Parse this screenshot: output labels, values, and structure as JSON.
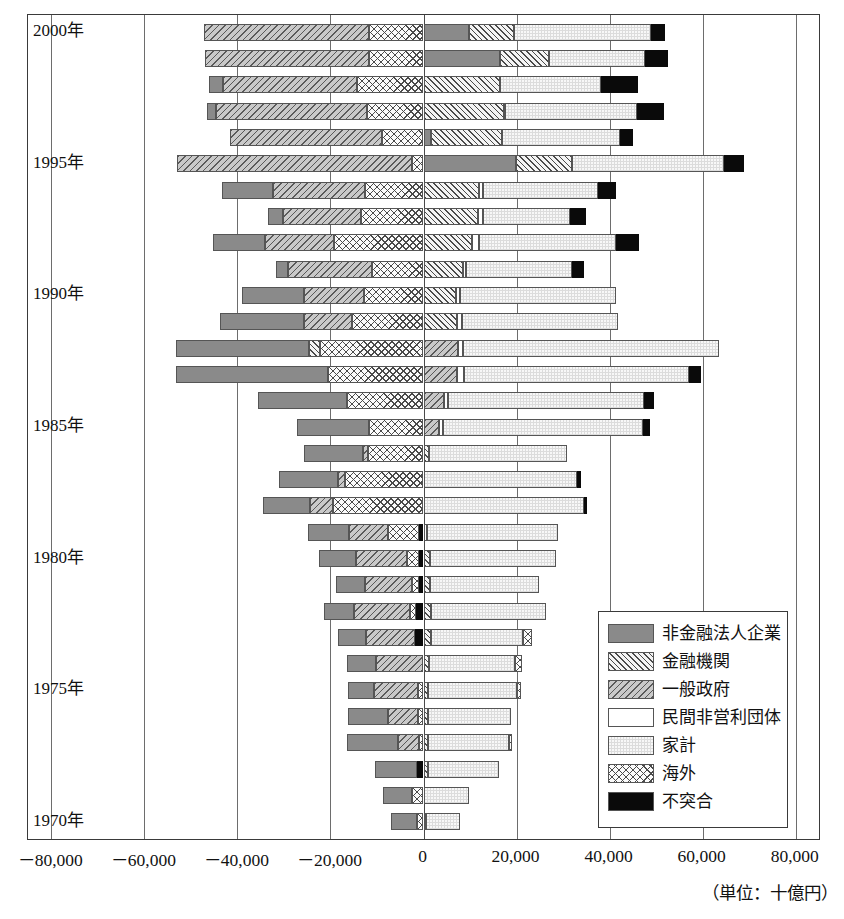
{
  "axis": {
    "unit_note": "（単位：十億円）",
    "x_ticks": [
      {
        "label": "－80,000",
        "value": -80000
      },
      {
        "label": "－60,000",
        "value": -60000
      },
      {
        "label": "－40,000",
        "value": -40000
      },
      {
        "label": "－20,000",
        "value": -20000
      },
      {
        "label": "0",
        "value": 0
      },
      {
        "label": "20,000",
        "value": 20000
      },
      {
        "label": "40,000",
        "value": 40000
      },
      {
        "label": "60,000",
        "value": 60000
      },
      {
        "label": "80,000",
        "value": 80000
      }
    ],
    "xlim": [
      -85000,
      85000
    ],
    "year_labels": [
      {
        "label": "2000年",
        "year": 2000
      },
      {
        "label": "1995年",
        "year": 1995
      },
      {
        "label": "1990年",
        "year": 1990
      },
      {
        "label": "1985年",
        "year": 1985
      },
      {
        "label": "1980年",
        "year": 1980
      },
      {
        "label": "1975年",
        "year": 1975
      },
      {
        "label": "1970年",
        "year": 1970
      }
    ]
  },
  "legend": {
    "items": [
      {
        "key": "corp",
        "label": "非金融法人企業",
        "fill": "f-corp"
      },
      {
        "key": "fin",
        "label": "金融機関",
        "fill": "f-fin"
      },
      {
        "key": "gov",
        "label": "一般政府",
        "fill": "f-gov"
      },
      {
        "key": "npo",
        "label": "民間非営利団体",
        "fill": "f-npo"
      },
      {
        "key": "house",
        "label": "家計",
        "fill": "f-house"
      },
      {
        "key": "abroad",
        "label": "海外",
        "fill": "f-abroad"
      },
      {
        "key": "disc",
        "label": "不突合",
        "fill": "f-disc"
      }
    ]
  },
  "chart_data": {
    "type": "bar",
    "orientation": "horizontal",
    "stacked": true,
    "title": "",
    "xlabel": "（単位：十億円）",
    "ylabel": "",
    "xlim": [
      -85000,
      85000
    ],
    "grid": true,
    "legend_position": "inside-bottom-right",
    "series_order_negative": [
      "abroad",
      "disc",
      "fin",
      "gov",
      "corp",
      "npo",
      "house"
    ],
    "series_order_positive": [
      "corp",
      "fin",
      "gov",
      "npo",
      "house",
      "abroad",
      "disc"
    ],
    "series_names": {
      "corp": "非金融法人企業",
      "fin": "金融機関",
      "gov": "一般政府",
      "npo": "民間非営利団体",
      "house": "家計",
      "abroad": "海外",
      "disc": "不突合"
    },
    "categories": [
      2000,
      1999,
      1998,
      1997,
      1996,
      1995,
      1994,
      1993,
      1992,
      1991,
      1990,
      1989,
      1988,
      1987,
      1986,
      1985,
      1984,
      1983,
      1982,
      1981,
      1980,
      1979,
      1978,
      1977,
      1976,
      1975,
      1974,
      1973,
      1972,
      1971,
      1970
    ],
    "rows": [
      {
        "year": 2000,
        "neg": [
          {
            "k": "abroad",
            "v": -11700
          },
          {
            "k": "gov",
            "v": -35500
          }
        ],
        "pos": [
          {
            "k": "corp",
            "v": 9800
          },
          {
            "k": "fin",
            "v": 9600
          },
          {
            "k": "house",
            "v": 29500
          },
          {
            "k": "disc",
            "v": 3100
          }
        ]
      },
      {
        "year": 1999,
        "neg": [
          {
            "k": "abroad",
            "v": -11700
          },
          {
            "k": "gov",
            "v": -35300
          }
        ],
        "pos": [
          {
            "k": "corp",
            "v": 16500
          },
          {
            "k": "fin",
            "v": 10400
          },
          {
            "k": "house",
            "v": 20700
          },
          {
            "k": "disc",
            "v": 5000
          }
        ]
      },
      {
        "year": 1998,
        "neg": [
          {
            "k": "abroad",
            "v": -14300
          },
          {
            "k": "gov",
            "v": -28800
          },
          {
            "k": "corp",
            "v": -3000
          }
        ],
        "pos": [
          {
            "k": "fin",
            "v": 16400
          },
          {
            "k": "house",
            "v": 21700
          },
          {
            "k": "disc",
            "v": 8000
          }
        ]
      },
      {
        "year": 1997,
        "neg": [
          {
            "k": "abroad",
            "v": -12200
          },
          {
            "k": "gov",
            "v": -32300
          },
          {
            "k": "corp",
            "v": -2000
          }
        ],
        "pos": [
          {
            "k": "fin",
            "v": 17200
          },
          {
            "k": "npo",
            "v": 400
          },
          {
            "k": "house",
            "v": 28300
          },
          {
            "k": "disc",
            "v": 5700
          }
        ]
      },
      {
        "year": 1996,
        "neg": [
          {
            "k": "abroad",
            "v": -9000
          },
          {
            "k": "gov",
            "v": -32500
          }
        ],
        "pos": [
          {
            "k": "corp",
            "v": 1700
          },
          {
            "k": "fin",
            "v": 15200
          },
          {
            "k": "house",
            "v": 25300
          },
          {
            "k": "disc",
            "v": 2900
          }
        ]
      },
      {
        "year": 1995,
        "neg": [
          {
            "k": "abroad",
            "v": -2400
          },
          {
            "k": "gov",
            "v": -50600
          }
        ],
        "pos": [
          {
            "k": "corp",
            "v": 19800
          },
          {
            "k": "fin",
            "v": 12200
          },
          {
            "k": "house",
            "v": 32500
          },
          {
            "k": "disc",
            "v": 4400
          }
        ]
      },
      {
        "year": 1994,
        "neg": [
          {
            "k": "abroad",
            "v": -12600
          },
          {
            "k": "gov",
            "v": -19800
          },
          {
            "k": "corp",
            "v": -10900
          }
        ],
        "pos": [
          {
            "k": "fin",
            "v": 12000
          },
          {
            "k": "npo",
            "v": 700
          },
          {
            "k": "house",
            "v": 24700
          },
          {
            "k": "disc",
            "v": 4000
          }
        ]
      },
      {
        "year": 1993,
        "neg": [
          {
            "k": "abroad",
            "v": -13500
          },
          {
            "k": "gov",
            "v": -16700
          },
          {
            "k": "corp",
            "v": -3200
          }
        ],
        "pos": [
          {
            "k": "fin",
            "v": 11700
          },
          {
            "k": "npo",
            "v": 1000
          },
          {
            "k": "house",
            "v": 18700
          },
          {
            "k": "disc",
            "v": 3500
          }
        ]
      },
      {
        "year": 1992,
        "neg": [
          {
            "k": "abroad",
            "v": -19200
          },
          {
            "k": "gov",
            "v": -14800
          },
          {
            "k": "corp",
            "v": -11300
          }
        ],
        "pos": [
          {
            "k": "fin",
            "v": 10500
          },
          {
            "k": "npo",
            "v": 1400
          },
          {
            "k": "house",
            "v": 29500
          },
          {
            "k": "disc",
            "v": 5000
          }
        ]
      },
      {
        "year": 1991,
        "neg": [
          {
            "k": "abroad",
            "v": -11100
          },
          {
            "k": "gov",
            "v": -18000
          },
          {
            "k": "corp",
            "v": -2700
          }
        ],
        "pos": [
          {
            "k": "fin",
            "v": 8400
          },
          {
            "k": "npo",
            "v": 800
          },
          {
            "k": "house",
            "v": 22700
          },
          {
            "k": "disc",
            "v": 2500
          }
        ]
      },
      {
        "year": 1990,
        "neg": [
          {
            "k": "abroad",
            "v": -12800
          },
          {
            "k": "gov",
            "v": -12900
          },
          {
            "k": "corp",
            "v": -13400
          }
        ],
        "pos": [
          {
            "k": "fin",
            "v": 7000
          },
          {
            "k": "npo",
            "v": 800
          },
          {
            "k": "house",
            "v": 33500
          }
        ]
      },
      {
        "year": 1989,
        "neg": [
          {
            "k": "abroad",
            "v": -15300
          },
          {
            "k": "gov",
            "v": -10400
          },
          {
            "k": "corp",
            "v": -18000
          }
        ],
        "pos": [
          {
            "k": "fin",
            "v": 7200
          },
          {
            "k": "npo",
            "v": 1100
          },
          {
            "k": "house",
            "v": 33400
          }
        ]
      },
      {
        "year": 1988,
        "neg": [
          {
            "k": "abroad",
            "v": -22200
          },
          {
            "k": "fin",
            "v": -2400
          },
          {
            "k": "corp",
            "v": -28600
          }
        ],
        "pos": [
          {
            "k": "gov",
            "v": 7500
          },
          {
            "k": "npo",
            "v": 1000
          },
          {
            "k": "house",
            "v": 55100
          }
        ]
      },
      {
        "year": 1987,
        "neg": [
          {
            "k": "abroad",
            "v": -20600
          },
          {
            "k": "corp",
            "v": -32500
          }
        ],
        "pos": [
          {
            "k": "gov",
            "v": 7300
          },
          {
            "k": "npo",
            "v": 1300
          },
          {
            "k": "house",
            "v": 48500
          },
          {
            "k": "disc",
            "v": 2600
          }
        ]
      },
      {
        "year": 1986,
        "neg": [
          {
            "k": "abroad",
            "v": -16500
          },
          {
            "k": "corp",
            "v": -19000
          }
        ],
        "pos": [
          {
            "k": "gov",
            "v": 4300
          },
          {
            "k": "npo",
            "v": 900
          },
          {
            "k": "house",
            "v": 42100
          },
          {
            "k": "disc",
            "v": 2200
          }
        ]
      },
      {
        "year": 1985,
        "neg": [
          {
            "k": "abroad",
            "v": -11700
          },
          {
            "k": "corp",
            "v": -15500
          }
        ],
        "pos": [
          {
            "k": "gov",
            "v": 3400
          },
          {
            "k": "npo",
            "v": 700
          },
          {
            "k": "house",
            "v": 43100
          },
          {
            "k": "disc",
            "v": 1500
          }
        ]
      },
      {
        "year": 1984,
        "neg": [
          {
            "k": "abroad",
            "v": -12000
          },
          {
            "k": "gov",
            "v": -1000
          },
          {
            "k": "corp",
            "v": -12600
          }
        ],
        "pos": [
          {
            "k": "fin",
            "v": 1200
          },
          {
            "k": "house",
            "v": 29600
          }
        ]
      },
      {
        "year": 1983,
        "neg": [
          {
            "k": "abroad",
            "v": -16800
          },
          {
            "k": "gov",
            "v": -1600
          },
          {
            "k": "corp",
            "v": -12700
          }
        ],
        "pos": [
          {
            "k": "house",
            "v": 32900
          },
          {
            "k": "disc",
            "v": 900
          }
        ]
      },
      {
        "year": 1982,
        "neg": [
          {
            "k": "abroad",
            "v": -19500
          },
          {
            "k": "gov",
            "v": -4900
          },
          {
            "k": "corp",
            "v": -10000
          }
        ],
        "pos": [
          {
            "k": "house",
            "v": 34400
          },
          {
            "k": "disc",
            "v": 700
          }
        ]
      },
      {
        "year": 1981,
        "neg": [
          {
            "k": "disc",
            "v": -900
          },
          {
            "k": "abroad",
            "v": -6700
          },
          {
            "k": "gov",
            "v": -8400
          },
          {
            "k": "corp",
            "v": -8800
          }
        ],
        "pos": [
          {
            "k": "npo",
            "v": 700
          },
          {
            "k": "house",
            "v": 28300
          }
        ]
      },
      {
        "year": 1980,
        "neg": [
          {
            "k": "disc",
            "v": -900
          },
          {
            "k": "abroad",
            "v": -2600
          },
          {
            "k": "gov",
            "v": -11000
          },
          {
            "k": "corp",
            "v": -7900
          }
        ],
        "pos": [
          {
            "k": "fin",
            "v": 1400
          },
          {
            "k": "house",
            "v": 27100
          }
        ]
      },
      {
        "year": 1979,
        "neg": [
          {
            "k": "disc",
            "v": -1000
          },
          {
            "k": "abroad",
            "v": -1500
          },
          {
            "k": "gov",
            "v": -10000
          },
          {
            "k": "corp",
            "v": -6300
          }
        ],
        "pos": [
          {
            "k": "fin",
            "v": 1400
          },
          {
            "k": "house",
            "v": 23400
          }
        ]
      },
      {
        "year": 1978,
        "neg": [
          {
            "k": "disc",
            "v": -1600
          },
          {
            "k": "abroad",
            "v": -1300
          },
          {
            "k": "gov",
            "v": -12100
          },
          {
            "k": "corp",
            "v": -6300
          }
        ],
        "pos": [
          {
            "k": "fin",
            "v": 1600
          },
          {
            "k": "house",
            "v": 24700
          }
        ]
      },
      {
        "year": 1977,
        "neg": [
          {
            "k": "disc",
            "v": -1900
          },
          {
            "k": "gov",
            "v": -10400
          },
          {
            "k": "corp",
            "v": -6100
          }
        ],
        "pos": [
          {
            "k": "fin",
            "v": 1700
          },
          {
            "k": "house",
            "v": 19700
          },
          {
            "k": "abroad",
            "v": 1900
          }
        ]
      },
      {
        "year": 1976,
        "neg": [
          {
            "k": "gov",
            "v": -10300
          },
          {
            "k": "corp",
            "v": -6200
          }
        ],
        "pos": [
          {
            "k": "fin",
            "v": 1100
          },
          {
            "k": "house",
            "v": 18600
          },
          {
            "k": "abroad",
            "v": 1400
          }
        ]
      },
      {
        "year": 1975,
        "neg": [
          {
            "k": "abroad",
            "v": -1200
          },
          {
            "k": "gov",
            "v": -9500
          },
          {
            "k": "corp",
            "v": -5500
          }
        ],
        "pos": [
          {
            "k": "fin",
            "v": 900
          },
          {
            "k": "house",
            "v": 19300
          },
          {
            "k": "abroad",
            "v": 800
          }
        ]
      },
      {
        "year": 1974,
        "neg": [
          {
            "k": "abroad",
            "v": -1100
          },
          {
            "k": "gov",
            "v": -6500
          },
          {
            "k": "corp",
            "v": -8700
          }
        ],
        "pos": [
          {
            "k": "fin",
            "v": 900
          },
          {
            "k": "house",
            "v": 17800
          }
        ]
      },
      {
        "year": 1973,
        "neg": [
          {
            "k": "abroad",
            "v": -900
          },
          {
            "k": "gov",
            "v": -4600
          },
          {
            "k": "corp",
            "v": -10900
          }
        ],
        "pos": [
          {
            "k": "fin",
            "v": 1000
          },
          {
            "k": "house",
            "v": 17400
          },
          {
            "k": "abroad",
            "v": 600
          }
        ]
      },
      {
        "year": 1972,
        "neg": [
          {
            "k": "disc",
            "v": -1400
          },
          {
            "k": "corp",
            "v": -9000
          }
        ],
        "pos": [
          {
            "k": "fin",
            "v": 900
          },
          {
            "k": "house",
            "v": 15400
          }
        ]
      },
      {
        "year": 1971,
        "neg": [
          {
            "k": "abroad",
            "v": -2400
          },
          {
            "k": "corp",
            "v": -6400
          }
        ],
        "pos": [
          {
            "k": "house",
            "v": 9700
          }
        ]
      },
      {
        "year": 1970,
        "neg": [
          {
            "k": "abroad",
            "v": -1400
          },
          {
            "k": "corp",
            "v": -5600
          }
        ],
        "pos": [
          {
            "k": "fin",
            "v": 600
          },
          {
            "k": "house",
            "v": 7200
          }
        ]
      }
    ]
  }
}
